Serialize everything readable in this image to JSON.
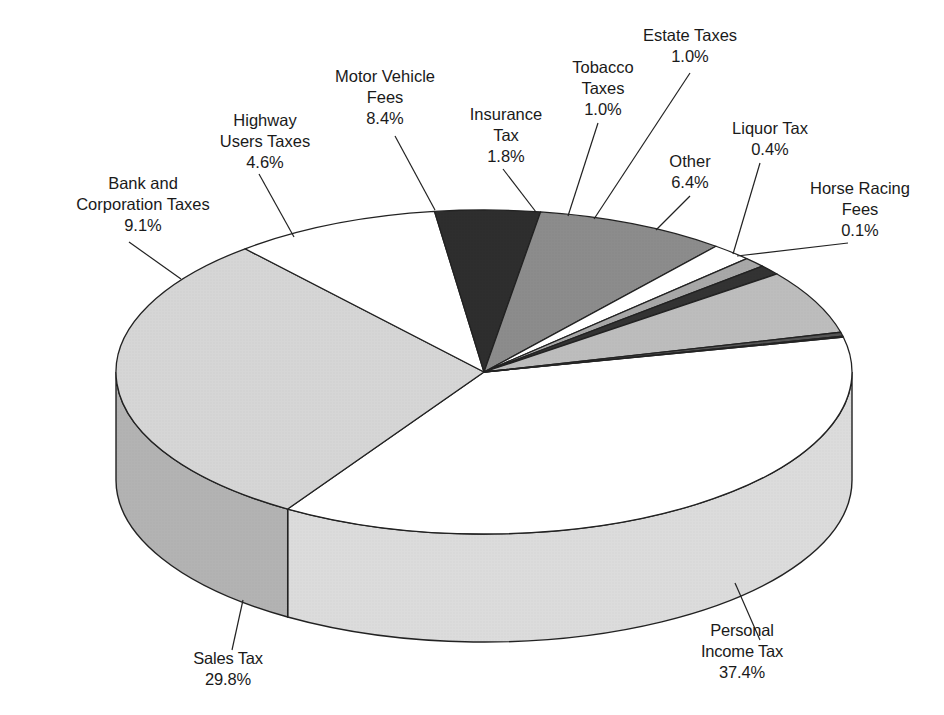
{
  "chart_data": {
    "type": "pie",
    "title": "",
    "style": "3d-pie",
    "legend": "none (callout labels)",
    "slices": [
      {
        "label": "Personal Income Tax",
        "value": 37.4,
        "unit": "%",
        "color": "#ffffff",
        "side_color": "#dcdcdc"
      },
      {
        "label": "Sales Tax",
        "value": 29.8,
        "unit": "%",
        "color": "#d6d6d6",
        "side_color": "#b3b3b3"
      },
      {
        "label": "Bank and Corporation Taxes",
        "value": 9.1,
        "unit": "%",
        "color": "#ffffff",
        "side_color": "#dcdcdc"
      },
      {
        "label": "Highway Users Taxes",
        "value": 4.6,
        "unit": "%",
        "color": "#2e2e2e",
        "side_color": "#222222"
      },
      {
        "label": "Motor Vehicle Fees",
        "value": 8.4,
        "unit": "%",
        "color": "#8c8c8c",
        "side_color": "#707070"
      },
      {
        "label": "Insurance Tax",
        "value": 1.8,
        "unit": "%",
        "color": "#ffffff",
        "side_color": "#dcdcdc"
      },
      {
        "label": "Tobacco Taxes",
        "value": 1.0,
        "unit": "%",
        "color": "#a8a8a8",
        "side_color": "#8a8a8a"
      },
      {
        "label": "Estate Taxes",
        "value": 1.0,
        "unit": "%",
        "color": "#333333",
        "side_color": "#222222"
      },
      {
        "label": "Other",
        "value": 6.4,
        "unit": "%",
        "color": "#bdbdbd",
        "side_color": "#9c9c9c"
      },
      {
        "label": "Liquor Tax",
        "value": 0.4,
        "unit": "%",
        "color": "#555555",
        "side_color": "#444444"
      },
      {
        "label": "Horse Racing Fees",
        "value": 0.1,
        "unit": "%",
        "color": "#999999",
        "side_color": "#777777"
      }
    ]
  },
  "labels": {
    "personal_income": {
      "line1": "Personal",
      "line2": "Income Tax",
      "value": "37.4%"
    },
    "sales": {
      "line1": "Sales Tax",
      "value": "29.8%"
    },
    "bank": {
      "line1": "Bank and",
      "line2": "Corporation Taxes",
      "value": "9.1%"
    },
    "highway": {
      "line1": "Highway",
      "line2": "Users Taxes",
      "value": "4.6%"
    },
    "motor": {
      "line1": "Motor Vehicle",
      "line2": "Fees",
      "value": "8.4%"
    },
    "insurance": {
      "line1": "Insurance",
      "line2": "Tax",
      "value": "1.8%"
    },
    "tobacco": {
      "line1": "Tobacco",
      "line2": "Taxes",
      "value": "1.0%"
    },
    "estate": {
      "line1": "Estate Taxes",
      "value": "1.0%"
    },
    "other": {
      "line1": "Other",
      "value": "6.4%"
    },
    "liquor": {
      "line1": "Liquor Tax",
      "value": "0.4%"
    },
    "horse": {
      "line1": "Horse Racing",
      "line2": "Fees",
      "value": "0.1%"
    }
  }
}
